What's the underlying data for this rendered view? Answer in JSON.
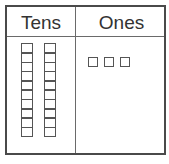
{
  "chart": {
    "columns": [
      {
        "label": "Tens"
      },
      {
        "label": "Ones"
      }
    ],
    "tens_rods": 2,
    "cells_per_rod": 10,
    "ones_units": 3,
    "represented_value": 23
  },
  "colors": {
    "border": "#4a4a4a",
    "line": "#6a6a6a",
    "text": "#333333",
    "background": "#ffffff"
  }
}
